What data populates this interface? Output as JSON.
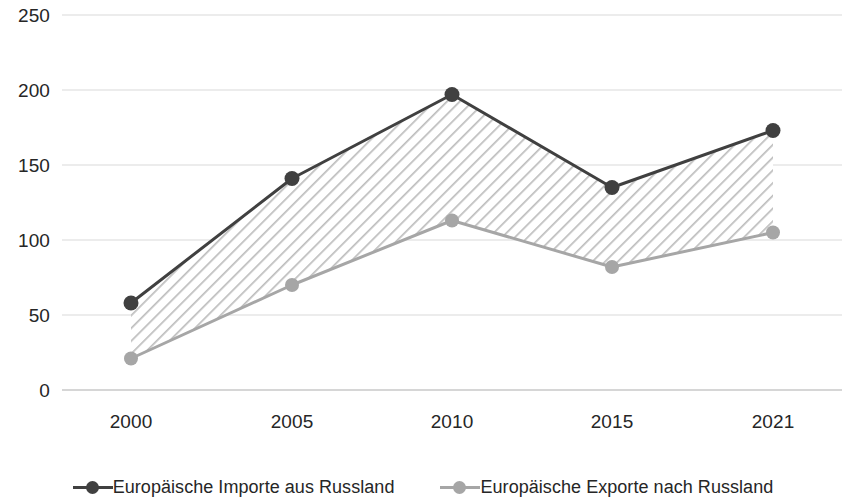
{
  "chart_data": {
    "type": "line",
    "title": "",
    "subtitle": "",
    "xlabel": "",
    "ylabel": "",
    "categories": [
      "2000",
      "2005",
      "2010",
      "2015",
      "2021"
    ],
    "ylim": [
      0,
      250
    ],
    "y_ticks": [
      0,
      50,
      100,
      150,
      200,
      250
    ],
    "y_tick_labels": [
      "0",
      "50",
      "100",
      "150",
      "200",
      "250"
    ],
    "grid": "horizontal",
    "legend_position": "bottom",
    "fill_between_series": true,
    "fill_style": "diagonal-hatch",
    "series": [
      {
        "name": "Europäische Importe aus Russland",
        "values": [
          58,
          141,
          197,
          135,
          173
        ],
        "color": "#404040",
        "marker": "circle"
      },
      {
        "name": "Europäische Exporte nach Russland",
        "values": [
          21,
          70,
          113,
          82,
          105
        ],
        "color": "#a6a6a6",
        "marker": "circle"
      }
    ]
  },
  "axis": {
    "y_labels": [
      "250",
      "200",
      "150",
      "100",
      "50",
      "0"
    ],
    "x_labels": [
      "2000",
      "2005",
      "2010",
      "2015",
      "2021"
    ]
  },
  "legend": {
    "items": [
      {
        "label": "Europäische Importe aus Russland",
        "color": "#404040"
      },
      {
        "label": "Europäische Exporte nach Russland",
        "color": "#a6a6a6"
      }
    ]
  },
  "colors": {
    "imports": "#404040",
    "exports": "#a6a6a6",
    "gridline": "#d9d9d9",
    "hatch": "#bfbfbf",
    "text": "#262626",
    "background": "#ffffff"
  }
}
